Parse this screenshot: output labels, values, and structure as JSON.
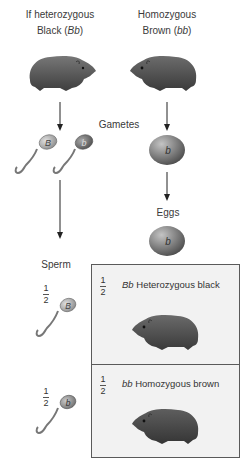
{
  "parents": {
    "left": {
      "line1": "If heterozygous",
      "line2_prefix": "Black (",
      "genotype": "Bb",
      "line2_suffix": ")"
    },
    "right": {
      "line1": "Homozygous",
      "line2_prefix": "Brown (",
      "genotype": "bb",
      "line2_suffix": ")"
    }
  },
  "labels": {
    "gametes": "Gametes",
    "eggs": "Eggs",
    "sperm": "Sperm"
  },
  "gametes": {
    "sperm": [
      {
        "allele": "B",
        "color": "#b5b5b5"
      },
      {
        "allele": "b",
        "color": "#6e6e6e"
      }
    ],
    "egg": {
      "allele": "b",
      "color": "#7a7a7a"
    }
  },
  "punnett": {
    "egg_allele": "b",
    "rows": [
      {
        "sperm_allele": "B",
        "sperm_fraction": {
          "num": "1",
          "den": "2"
        },
        "fraction": {
          "num": "1",
          "den": "2"
        },
        "genotype": "Bb",
        "phenotype": "Heterozygous black"
      },
      {
        "sperm_allele": "b",
        "sperm_fraction": {
          "num": "1",
          "den": "2"
        },
        "fraction": {
          "num": "1",
          "den": "2"
        },
        "genotype": "bb",
        "phenotype": "Homozygous brown"
      }
    ]
  },
  "colors": {
    "box_bg": "#f2f2f2",
    "box_border": "#5a5a5a",
    "guinea_pig_black": "#4a4a4a",
    "guinea_pig_brown": "#5c5c5c",
    "arrow": "#222222"
  }
}
